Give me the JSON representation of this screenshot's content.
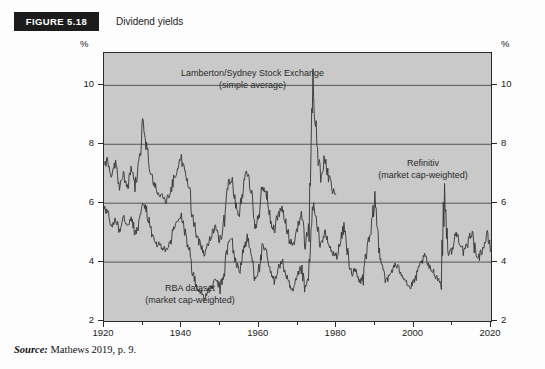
{
  "figure": {
    "tag": "FIGURE 5.18",
    "caption": "Dividend yields"
  },
  "source": {
    "keyword": "Source:",
    "text": " Mathews 2019, p. 9."
  },
  "colors": {
    "plot_background": "#c9c9c9",
    "frame": "#2b2b2b",
    "gridline": "#4a4a4a",
    "series_line": "#3a3a3a",
    "tag_background": "#1c1c1c",
    "tag_text": "#ffffff"
  },
  "annotations": [
    {
      "id": "lamberton",
      "line1": "Lamberton/Sydney Stock Exchange",
      "line2": "(simple average)"
    },
    {
      "id": "refinitiv",
      "line1": "Refinitiv",
      "line2": "(market cap-weighted)"
    },
    {
      "id": "rba",
      "line1": "RBA dataset",
      "line2": "(market cap-weighted)"
    }
  ],
  "chart_data": {
    "type": "line",
    "title": "Dividend yields",
    "xlabel": "",
    "ylabel": "%",
    "y_unit_label": "%",
    "xlim": [
      1920,
      2020
    ],
    "ylim": [
      2,
      11.1
    ],
    "yticks": [
      2,
      4,
      6,
      8,
      10
    ],
    "ytick_labels": [
      "2",
      "4",
      "6",
      "8",
      "10"
    ],
    "xticks": [
      1920,
      1940,
      1960,
      1980,
      2000,
      2020
    ],
    "xtick_labels": [
      "1920",
      "1940",
      "1960",
      "1980",
      "2000",
      "2020"
    ],
    "x_minor_ticks": [
      1930,
      1950,
      1970,
      1990,
      2010
    ],
    "grid": "horizontal",
    "legend_position": "in-plot annotations",
    "series": [
      {
        "name": "Lamberton/Sydney Stock Exchange (simple average)",
        "note": "simple average",
        "x": [
          1920,
          1921,
          1922,
          1923,
          1924,
          1925,
          1926,
          1927,
          1928,
          1929,
          1930,
          1931,
          1932,
          1933,
          1934,
          1935,
          1936,
          1937,
          1938,
          1939,
          1940,
          1941,
          1942,
          1943,
          1944,
          1945,
          1946,
          1947,
          1948,
          1949,
          1950,
          1951,
          1952,
          1953,
          1954,
          1955,
          1956,
          1957,
          1958,
          1959,
          1960,
          1961,
          1962,
          1963,
          1964,
          1965,
          1966,
          1967,
          1968,
          1969,
          1970,
          1971,
          1972,
          1973,
          1974,
          1975,
          1976,
          1977,
          1978,
          1979,
          1980
        ],
        "values": [
          7.2,
          7.5,
          6.9,
          7.4,
          6.6,
          7.0,
          6.5,
          7.1,
          6.6,
          7.3,
          8.7,
          7.9,
          7.1,
          6.6,
          6.4,
          6.2,
          6.1,
          6.3,
          6.8,
          7.2,
          7.5,
          7.0,
          6.5,
          5.5,
          4.8,
          4.6,
          4.3,
          4.7,
          5.0,
          5.2,
          4.7,
          5.3,
          6.6,
          6.9,
          6.0,
          5.6,
          6.6,
          7.1,
          6.4,
          5.2,
          5.6,
          6.6,
          6.3,
          5.4,
          5.1,
          5.6,
          5.8,
          5.3,
          4.7,
          4.6,
          5.2,
          5.6,
          4.6,
          5.3,
          10.3,
          7.8,
          6.9,
          7.5,
          6.9,
          6.4,
          6.3
        ]
      },
      {
        "name": "RBA dataset (market cap-weighted)",
        "note": "market cap-weighted",
        "x": [
          1920,
          1921,
          1922,
          1923,
          1924,
          1925,
          1926,
          1927,
          1928,
          1929,
          1930,
          1931,
          1932,
          1933,
          1934,
          1935,
          1936,
          1937,
          1938,
          1939,
          1940,
          1941,
          1942,
          1943,
          1944,
          1945,
          1946,
          1947,
          1948,
          1949,
          1950,
          1951,
          1952,
          1953,
          1954,
          1955,
          1956,
          1957,
          1958,
          1959,
          1960,
          1961,
          1962,
          1963,
          1964,
          1965,
          1966,
          1967,
          1968,
          1969,
          1970,
          1971,
          1972,
          1973,
          1974,
          1975,
          1976,
          1977,
          1978,
          1979,
          1980
        ],
        "values": [
          5.9,
          5.6,
          5.2,
          5.5,
          5.1,
          5.6,
          5.3,
          5.5,
          5.0,
          5.2,
          6.0,
          5.8,
          5.1,
          4.7,
          4.6,
          4.5,
          4.4,
          4.6,
          5.1,
          5.4,
          5.5,
          5.0,
          4.4,
          3.6,
          3.1,
          3.0,
          2.8,
          3.0,
          3.2,
          3.4,
          3.1,
          3.6,
          4.6,
          4.8,
          4.0,
          3.7,
          4.4,
          4.8,
          4.3,
          3.5,
          3.7,
          4.5,
          4.3,
          3.6,
          3.4,
          3.8,
          4.0,
          3.6,
          3.1,
          3.0,
          3.5,
          3.8,
          3.0,
          3.6,
          6.0,
          5.2,
          4.6,
          5.0,
          4.6,
          4.3,
          4.2
        ]
      },
      {
        "name": "Refinitiv (market cap-weighted)",
        "note": "market cap-weighted",
        "x": [
          1980,
          1981,
          1982,
          1983,
          1984,
          1985,
          1986,
          1987,
          1988,
          1989,
          1990,
          1991,
          1992,
          1993,
          1994,
          1995,
          1996,
          1997,
          1998,
          1999,
          2000,
          2001,
          2002,
          2003,
          2004,
          2005,
          2006,
          2007,
          2008,
          2009,
          2010,
          2011,
          2012,
          2013,
          2014,
          2015,
          2016,
          2017,
          2018,
          2019,
          2020
        ],
        "values": [
          4.2,
          4.6,
          5.2,
          4.3,
          3.6,
          3.7,
          3.3,
          3.5,
          4.6,
          4.9,
          6.2,
          4.5,
          3.9,
          3.3,
          3.6,
          3.9,
          3.8,
          3.6,
          3.4,
          3.1,
          3.3,
          3.6,
          4.0,
          4.2,
          3.8,
          3.7,
          3.5,
          3.3,
          6.3,
          4.3,
          4.4,
          5.0,
          4.7,
          4.3,
          4.6,
          5.1,
          4.3,
          4.2,
          4.5,
          4.9,
          4.4
        ]
      }
    ]
  }
}
